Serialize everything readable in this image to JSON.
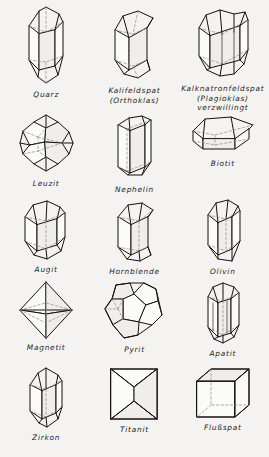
{
  "figure": {
    "background_color": "#f4f3f1",
    "line_color": "#15110f",
    "hidden_edge_color": "#8e8782",
    "columns": 3,
    "rows": 5
  },
  "specimens": [
    {
      "index": 1,
      "caption": "Quarz",
      "habit": "doubly-terminated hexagonal prism",
      "row": 1,
      "column": 1
    },
    {
      "index": 2,
      "caption": "Kalifeldspat\n(Orthoklas)",
      "habit": "monoclinic prism",
      "row": 1,
      "column": 2
    },
    {
      "index": 3,
      "caption": "Kalknatronfeldspat\n(Plagioklas)\nverzwillingt",
      "habit": "polysynthetic twinned prism",
      "row": 1,
      "column": 3
    },
    {
      "index": 4,
      "caption": "Leuzit",
      "habit": "trapezohedron",
      "row": 2,
      "column": 1
    },
    {
      "index": 5,
      "caption": "Nephelin",
      "habit": "hexagonal prism",
      "row": 2,
      "column": 2
    },
    {
      "index": 6,
      "caption": "Biotit",
      "habit": "tabular hexagonal plate",
      "row": 2,
      "column": 3
    },
    {
      "index": 7,
      "caption": "Augit",
      "habit": "short prism",
      "row": 3,
      "column": 1
    },
    {
      "index": 8,
      "caption": "Hornblende",
      "habit": "elongated prism",
      "row": 3,
      "column": 2
    },
    {
      "index": 9,
      "caption": "Olivin",
      "habit": "prism with wedge termination",
      "row": 3,
      "column": 3
    },
    {
      "index": 10,
      "caption": "Magnetit",
      "habit": "octahedron",
      "row": 4,
      "column": 1
    },
    {
      "index": 11,
      "caption": "Pyrit",
      "habit": "pentagonal dodecahedron",
      "row": 4,
      "column": 2
    },
    {
      "index": 12,
      "caption": "Apatit",
      "habit": "hexagonal prism with pyramid",
      "row": 4,
      "column": 3
    },
    {
      "index": 13,
      "caption": "Zirkon",
      "habit": "tetragonal prism with bipyramid",
      "row": 5,
      "column": 1
    },
    {
      "index": 14,
      "caption": "Titanit",
      "habit": "wedge-shaped crystal",
      "row": 5,
      "column": 2
    },
    {
      "index": 15,
      "caption": "Flußspat",
      "habit": "cube",
      "row": 5,
      "column": 3
    }
  ]
}
